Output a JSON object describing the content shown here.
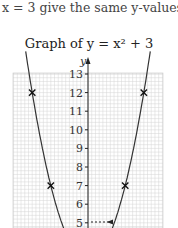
{
  "caption": "x = 3 give the same y-values.",
  "title": "Graph of y = x² + 3",
  "chart_data": {
    "type": "line",
    "title": "Graph of y = x² + 3",
    "xlabel": "",
    "ylabel": "y",
    "function": "y = x^2 + 3",
    "ylim": [
      5,
      13
    ],
    "y_ticks": [
      5,
      6,
      7,
      8,
      9,
      10,
      11,
      12,
      13
    ],
    "grid": true,
    "marked_points": [
      {
        "x": -3,
        "y": 12
      },
      {
        "x": -2,
        "y": 7
      },
      {
        "x": 2,
        "y": 7
      },
      {
        "x": 3,
        "y": 12
      }
    ],
    "annotations": [
      {
        "type": "dashed-arrow",
        "from": {
          "x": 1.4,
          "y": 5.2
        },
        "to": {
          "x": 0,
          "y": 5.2
        },
        "direction": "left"
      }
    ]
  },
  "labels": {
    "y_axis": "y",
    "ticks": [
      "13",
      "12",
      "11",
      "10",
      "9",
      "8",
      "7",
      "6",
      "5"
    ]
  }
}
